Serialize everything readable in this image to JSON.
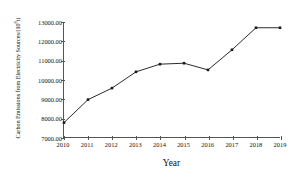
{
  "chart_data": {
    "type": "line",
    "title": "",
    "xlabel": "Year",
    "ylabel": "Carbon Emissions from Electricity Sources/(10⁸t)",
    "ylabel_base": "Carbon Emissions from Electricity Sources/(10",
    "ylabel_exp": "8",
    "ylabel_tail": "t)",
    "categories": [
      "2010",
      "2011",
      "2012",
      "2013",
      "2014",
      "2015",
      "2016",
      "2017",
      "2018",
      "2019"
    ],
    "values": [
      7750,
      8950,
      9550,
      10400,
      10800,
      10850,
      10500,
      11550,
      12700,
      12700
    ],
    "series": [
      {
        "name": "Carbon Emissions from Electricity Sources",
        "values": [
          7750,
          8950,
          9550,
          10400,
          10800,
          10850,
          10500,
          11550,
          12700,
          12700
        ]
      }
    ],
    "ylim": [
      7000,
      13000
    ],
    "xlim": [
      2010,
      2019
    ],
    "ytick_values": [
      7000,
      8000,
      9000,
      10000,
      11000,
      12000,
      13000
    ],
    "ytick_labels": [
      "7000.00",
      "8000.00",
      "9000.00",
      "10000.00",
      "11000.00",
      "12000.00",
      "13000.00"
    ],
    "xtick_labels": [
      "2010",
      "2011",
      "2012",
      "2013",
      "2014",
      "2015",
      "2016",
      "2017",
      "2018",
      "2019"
    ],
    "grid": false,
    "legend": "none",
    "marker": "square",
    "line_color": "#2b2b2b",
    "marker_color": "#1a1a1a",
    "axis_color": "#555555",
    "background": "#ffffff"
  }
}
